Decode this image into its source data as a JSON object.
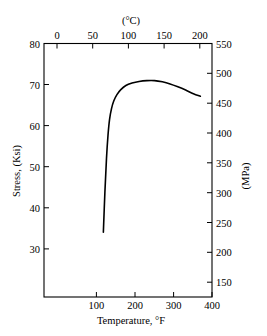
{
  "chart_data": {
    "type": "line",
    "title": "",
    "xlabel": "Temperature, °F",
    "ylabel": "Stress, (Ksi)",
    "secondary_xlabel": "(°C)",
    "secondary_ylabel": "(MPa)",
    "xlim": [
      -33,
      400
    ],
    "ylim": [
      18.5,
      80
    ],
    "secondary_xlim": [
      -36,
      204
    ],
    "secondary_ylim": [
      128,
      552
    ],
    "grid": false,
    "legend": null,
    "xticks": [
      100,
      200,
      300,
      400
    ],
    "xtick_labels": [
      "100",
      "200",
      "300",
      "400"
    ],
    "yticks": [
      30,
      40,
      50,
      60,
      70,
      80
    ],
    "ytick_labels": [
      "30",
      "40",
      "50",
      "60",
      "70",
      "80"
    ],
    "secondary_xticks": [
      0,
      50,
      100,
      150,
      200
    ],
    "secondary_xtick_labels": [
      "0",
      "50",
      "100",
      "150",
      "200"
    ],
    "secondary_yticks": [
      150,
      200,
      250,
      300,
      350,
      400,
      450,
      500,
      550
    ],
    "secondary_ytick_labels": [
      "150",
      "200",
      "250",
      "300",
      "350",
      "400",
      "450",
      "500",
      "550"
    ],
    "series": [
      {
        "name": "stress-vs-temperature",
        "color": "#000000",
        "x": [
          120,
          124,
          128,
          132,
          136,
          141,
          147,
          155,
          165,
          178,
          194,
          212,
          232,
          252,
          272,
          292,
          312,
          332,
          352,
          370
        ],
        "y": [
          34.2,
          44.0,
          52.0,
          57.8,
          61.6,
          64.2,
          66.1,
          67.6,
          68.8,
          69.8,
          70.4,
          70.8,
          71.0,
          71.0,
          70.7,
          70.2,
          69.5,
          68.7,
          67.8,
          67.2
        ]
      }
    ]
  },
  "axes": {
    "left_title": "Stress, (Ksi)",
    "right_title": "(MPa)",
    "bottom_title": "Temperature, °F",
    "top_title": "(°C)"
  }
}
